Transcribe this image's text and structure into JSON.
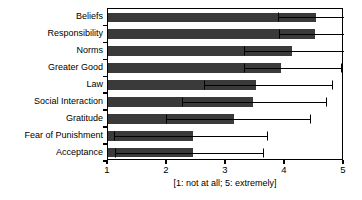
{
  "chart_data": {
    "type": "bar",
    "orientation": "horizontal",
    "title": "",
    "xlabel": "[1: not at all; 5: extremely]",
    "ylabel": "",
    "xlim": [
      1,
      5
    ],
    "xticks": [
      1,
      2,
      3,
      4,
      5
    ],
    "xticklabels": [
      "1",
      "2",
      "3",
      "4",
      "5"
    ],
    "grid": false,
    "legend": null,
    "categories": [
      "Beliefs",
      "Responsibility",
      "Norms",
      "Greater Good",
      "Law",
      "Social Interaction",
      "Gratitude",
      "Fear of Punishment",
      "Acceptance"
    ],
    "values": [
      4.52,
      4.5,
      4.12,
      3.93,
      3.5,
      3.46,
      3.14,
      2.44,
      2.44
    ],
    "errors_low": [
      3.88,
      3.9,
      3.3,
      3.3,
      2.62,
      2.25,
      1.98,
      1.1,
      1.12
    ],
    "errors_high": [
      5.0,
      5.0,
      5.0,
      4.95,
      4.8,
      4.7,
      4.42,
      3.7,
      3.62
    ],
    "bar_color": "#3a3a3a",
    "error_color": "#000000"
  }
}
